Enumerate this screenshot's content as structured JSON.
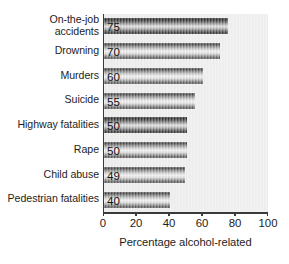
{
  "chart_data": {
    "type": "bar",
    "orientation": "horizontal",
    "title": "",
    "categories": [
      "On-the-job\naccidents",
      "Drowning",
      "Murders",
      "Suicide",
      "Highway fatalities",
      "Rape",
      "Child abuse",
      "Pedestrian fatalities"
    ],
    "values": [
      75,
      70,
      60,
      55,
      50,
      50,
      49,
      40
    ],
    "value_labels": [
      "75",
      "70",
      "60",
      "55",
      "50",
      "50",
      "49",
      "40"
    ],
    "highlighted": [
      true,
      false,
      false,
      false,
      true,
      false,
      false,
      false
    ],
    "xlabel": "Percentage alcohol-related",
    "ylabel": "",
    "xlim": [
      0,
      100
    ],
    "xticks": [
      0,
      20,
      40,
      60,
      80,
      100
    ],
    "xtick_labels": [
      "0",
      "20",
      "40",
      "60",
      "80",
      "100"
    ],
    "grid": false,
    "legend": null
  },
  "colors": {
    "plot_background": "#eeeeee",
    "axis": "#3a3a3a",
    "bar_light": "#cfcfcf",
    "bar_dark": "#5a5a5a",
    "text": "#1d1d1d"
  }
}
